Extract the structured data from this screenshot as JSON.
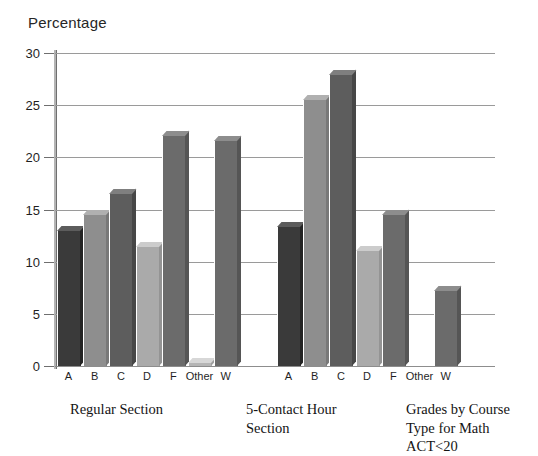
{
  "axis_title": "Percentage",
  "captions": {
    "group1": "Regular Section",
    "group2": "5-Contact Hour Section",
    "figure": "Grades by Course Type for Math ACT<20"
  },
  "chart_data": {
    "type": "bar",
    "title": "Grades by Course Type for Math ACT<20",
    "xlabel": "",
    "ylabel": "Percentage",
    "ylim": [
      0,
      30
    ],
    "yticks": [
      0,
      5,
      10,
      15,
      20,
      25,
      30
    ],
    "grid": true,
    "legend": "none",
    "categories": [
      "A",
      "B",
      "C",
      "D",
      "F",
      "Other",
      "W"
    ],
    "groups": [
      "Regular Section",
      "5-Contact Hour Section"
    ],
    "series": [
      {
        "name": "Regular Section",
        "values": [
          13.0,
          14.6,
          16.6,
          11.5,
          22.1,
          0.4,
          21.7
        ]
      },
      {
        "name": "5-Contact Hour Section",
        "values": [
          13.4,
          25.6,
          28.0,
          11.1,
          14.6,
          0.0,
          7.3
        ]
      }
    ],
    "bar_colors": {
      "A": "#3a3a3a",
      "B": "#8e8e8e",
      "C": "#5d5d5d",
      "D": "#aaaaaa",
      "F": "#6b6b6b",
      "Other": "#b5b5b5",
      "W": "#6b6b6b"
    }
  }
}
